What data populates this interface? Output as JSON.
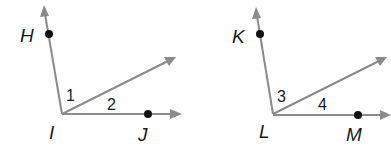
{
  "figures": [
    {
      "vertex": "I",
      "upper_point": "H",
      "lower_point": "J",
      "angle_labels": [
        "1",
        "2"
      ]
    },
    {
      "vertex": "L",
      "upper_point": "K",
      "lower_point": "M",
      "angle_labels": [
        "3",
        "4"
      ]
    }
  ],
  "colors": {
    "ray": "#8a8a8a",
    "point": "#111111",
    "text": "#1a1a1a"
  }
}
